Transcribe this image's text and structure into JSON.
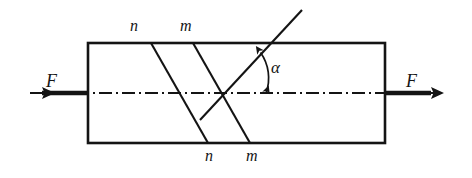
{
  "figure": {
    "type": "mechanics-diagram",
    "background_color": "#ffffff",
    "line_color": "#141414"
  },
  "labels": {
    "force_left": "F",
    "force_right": "F",
    "section_n_top": "n",
    "section_m_top": "m",
    "section_n_bottom": "n",
    "section_m_bottom": "m",
    "angle": "α"
  },
  "geometry": {
    "bar": {
      "x": 88,
      "y": 43,
      "width": 297,
      "height": 100
    },
    "axis": {
      "y": 93,
      "x_start": 30,
      "x_end": 443
    },
    "section_n_line": {
      "x_top": 151,
      "y_top": 43,
      "x_bottom": 208,
      "y_bottom": 143
    },
    "section_m_line": {
      "x_top": 193,
      "y_top": 43,
      "x_bottom": 250,
      "y_bottom": 143
    },
    "normal_line": {
      "x_start": 200,
      "y_start": 135,
      "x_end": 302,
      "y_end": 10
    },
    "angle_vertex": {
      "x": 222,
      "y": 93
    },
    "angle_value_deg": 51
  },
  "arrows": {
    "left_force": {
      "tip_x": 30,
      "tail_x": 88,
      "y": 93,
      "direction": "left"
    },
    "right_force": {
      "tip_x": 443,
      "tail_x": 385,
      "y": 93,
      "direction": "right"
    }
  },
  "label_positions": {
    "force_left": {
      "x": 46,
      "y": 72
    },
    "force_right": {
      "x": 406,
      "y": 72
    },
    "section_n_top": {
      "x": 130,
      "y": 20
    },
    "section_m_top": {
      "x": 180,
      "y": 20
    },
    "section_n_bottom": {
      "x": 205,
      "y": 148
    },
    "section_m_bottom": {
      "x": 246,
      "y": 148
    },
    "angle": {
      "x": 269,
      "y": 60
    }
  }
}
